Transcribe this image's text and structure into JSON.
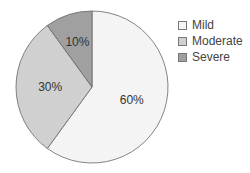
{
  "chart_data": {
    "type": "pie",
    "title": "",
    "categories": [
      "Mild",
      "Moderate",
      "Severe"
    ],
    "values": [
      60,
      30,
      10
    ],
    "labels": [
      "60%",
      "30%",
      "10%"
    ],
    "colors": [
      "#f4f4f4",
      "#d0d0d0",
      "#a0a0a0"
    ],
    "legend_position": "right"
  },
  "legend": {
    "items": [
      {
        "label": "Mild",
        "color": "#f4f4f4"
      },
      {
        "label": "Moderate",
        "color": "#d0d0d0"
      },
      {
        "label": "Severe",
        "color": "#a0a0a0"
      }
    ]
  }
}
